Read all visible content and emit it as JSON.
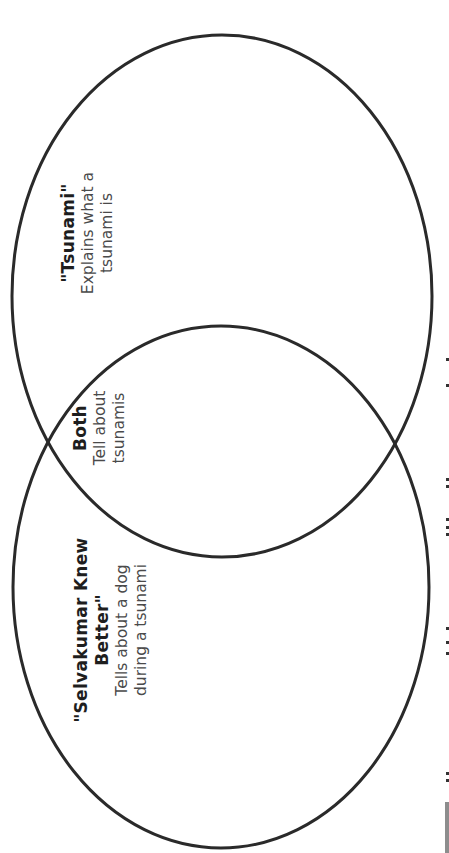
{
  "diagram": {
    "type": "venn",
    "orientation": "rotated-90-ccw",
    "stroke_color": "#2a2a2a",
    "sets": [
      {
        "id": "selvakumar",
        "title_lines": [
          "\"Selvakumar Knew",
          "Better\""
        ],
        "description_lines": [
          "Tells about a dog",
          "during a tsunami"
        ]
      },
      {
        "id": "both",
        "title_lines": [
          "Both"
        ],
        "description_lines": [
          "Tell about",
          "tsunamis"
        ]
      },
      {
        "id": "tsunami",
        "title_lines": [
          "\"Tsunami\""
        ],
        "description_lines": [
          "Explains what a",
          "tsunami is"
        ]
      }
    ]
  }
}
